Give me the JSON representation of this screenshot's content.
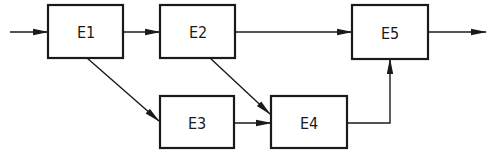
{
  "diagram": {
    "type": "block-diagram",
    "colors": {
      "stroke": "#1a1a1a",
      "background": "#ffffff"
    },
    "blocks": [
      {
        "id": "E1",
        "label": "E1"
      },
      {
        "id": "E2",
        "label": "E2"
      },
      {
        "id": "E3",
        "label": "E3"
      },
      {
        "id": "E4",
        "label": "E4"
      },
      {
        "id": "E5",
        "label": "E5"
      }
    ],
    "edges": [
      {
        "from": "input",
        "to": "E1"
      },
      {
        "from": "E1",
        "to": "E2"
      },
      {
        "from": "E1",
        "to": "E3"
      },
      {
        "from": "E2",
        "to": "E5"
      },
      {
        "from": "E2",
        "to": "E4"
      },
      {
        "from": "E3",
        "to": "E4"
      },
      {
        "from": "E4",
        "to": "E5"
      },
      {
        "from": "E5",
        "to": "output"
      }
    ]
  }
}
